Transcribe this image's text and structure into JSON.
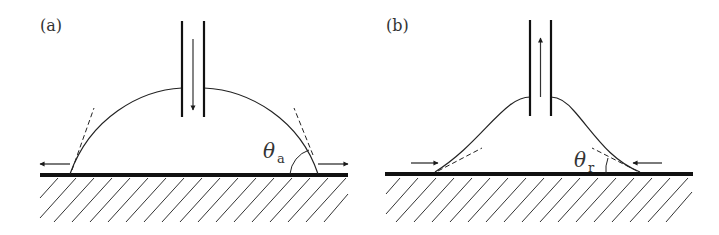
{
  "panels": [
    {
      "label": "(a)",
      "angle_symbol": "θ",
      "angle_subscript": "a",
      "description": "advancing contact angle: liquid pumped into droplet, contact line moves outward",
      "flow_direction": "down",
      "contact_line_motion": "outward"
    },
    {
      "label": "(b)",
      "angle_symbol": "θ",
      "angle_subscript": "r",
      "description": "receding contact angle: liquid withdrawn from droplet, contact line moves inward",
      "flow_direction": "up",
      "contact_line_motion": "inward"
    }
  ],
  "colors": {
    "line": "#222222",
    "background": "#ffffff"
  }
}
